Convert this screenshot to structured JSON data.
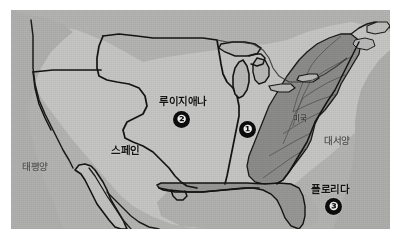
{
  "figure": {
    "kind": "historical-map-photo",
    "region": "North America",
    "palette": {
      "paper": "#bdbdbb",
      "ocean": "#b2b2b0",
      "ceded_territory": "#c2c2c0",
      "us_states": "#8e8e8c",
      "florida": "#9a9a98",
      "coastline": "#111111",
      "marker_fill": "#0c0c0c",
      "marker_text": "#f2f2f2",
      "label_dark": "#141414",
      "label_muted": "#5d5d5d"
    }
  },
  "labels": {
    "pacific_ocean": "태평양",
    "spain": "스페인",
    "louisiana": "루이지애나",
    "united_states": "미국",
    "atlantic_ocean": "대서양",
    "florida": "플로리다"
  },
  "markers": [
    {
      "id": "marker-1",
      "number": "❶",
      "label_ref": "united_states"
    },
    {
      "id": "marker-2",
      "number": "❷",
      "label_ref": "louisiana"
    },
    {
      "id": "marker-3",
      "number": "❸",
      "label_ref": "florida"
    }
  ]
}
